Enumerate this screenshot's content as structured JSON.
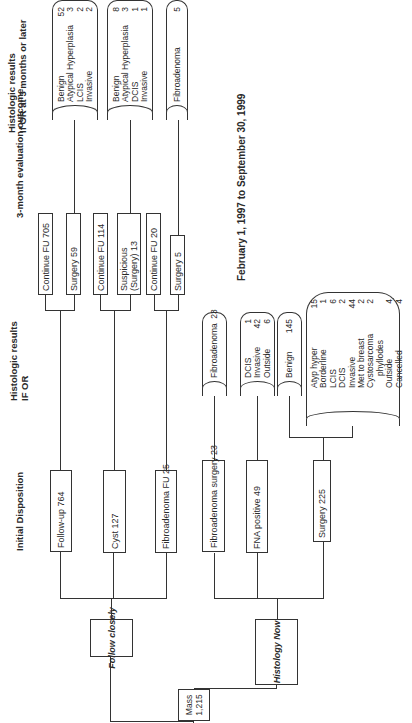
{
  "headings": {
    "initial_disposition": "Initial Disposition",
    "histologic_if_or_1": "Histologic results",
    "histologic_if_or_2": "IF OR",
    "three_month": "3-month evaluation outcome",
    "histologic_later_1": "Histologic results",
    "histologic_later_2": "If OR at 3 months or later"
  },
  "date_range": "February 1, 1997 to September 30, 1999",
  "root": {
    "label_1": "Mass",
    "label_2": "1,215"
  },
  "branches": {
    "follow_closely": "Follow closely",
    "histology_now": "Histology Now"
  },
  "follow_closely_dispositions": [
    {
      "label": "Follow-up 764"
    },
    {
      "label": "Cyst 127"
    },
    {
      "label": "Fibroadenoma FU 25"
    }
  ],
  "three_month_outcomes": [
    {
      "label": "Continue FU 705"
    },
    {
      "label": "Surgery 59"
    },
    {
      "label": "Continue FU 114"
    },
    {
      "label_1": "Suspicious",
      "label_2": "(Surgery) 13"
    },
    {
      "label": "Continue FU 20"
    },
    {
      "label": "Surgery 5"
    }
  ],
  "later_results": [
    {
      "rows": [
        {
          "name": "Benign",
          "n": "52"
        },
        {
          "name": "Atypical Hyperplasia",
          "n": "3"
        },
        {
          "name": "LCIS",
          "n": "2"
        },
        {
          "name": "Invasive",
          "n": "2"
        }
      ]
    },
    {
      "rows": [
        {
          "name": "Benign",
          "n": "8"
        },
        {
          "name": "Atypical Hyperplasia",
          "n": "3"
        },
        {
          "name": "DCIS",
          "n": "1"
        },
        {
          "name": "Invasive",
          "n": "1"
        }
      ]
    },
    {
      "rows": [
        {
          "name": "Fibroadenoma",
          "n": "5"
        }
      ]
    }
  ],
  "histology_now_dispositions": [
    {
      "label": "Fibroadenoma surgery 23"
    },
    {
      "label": "FNA positive 49"
    },
    {
      "label": "Surgery 225"
    }
  ],
  "histology_now_results": [
    {
      "rows": [
        {
          "name": "Fibroadenoma",
          "n": "23"
        }
      ]
    },
    {
      "rows": [
        {
          "name": "DCIS",
          "n": "1"
        },
        {
          "name": "Invasive",
          "n": "42"
        },
        {
          "name": "Outside",
          "n": "6"
        }
      ]
    },
    {
      "rows": [
        {
          "name": "Benign",
          "n": "145"
        }
      ]
    },
    {
      "rows": [
        {
          "name": "Atyp hyper",
          "n": "15"
        },
        {
          "name": "Borderline",
          "n": "1"
        },
        {
          "name": "LCIS",
          "n": "6"
        },
        {
          "name": "DCIS",
          "n": "2"
        },
        {
          "name": "Invasive",
          "n": "44"
        },
        {
          "name": "Met to breast",
          "n": "2"
        },
        {
          "name": "Cystosarcoma",
          "n": "2"
        },
        {
          "name": "   phyllodes",
          "n": ""
        },
        {
          "name": "Outside",
          "n": "4"
        },
        {
          "name": "Cancelled",
          "n": "4"
        }
      ]
    }
  ]
}
